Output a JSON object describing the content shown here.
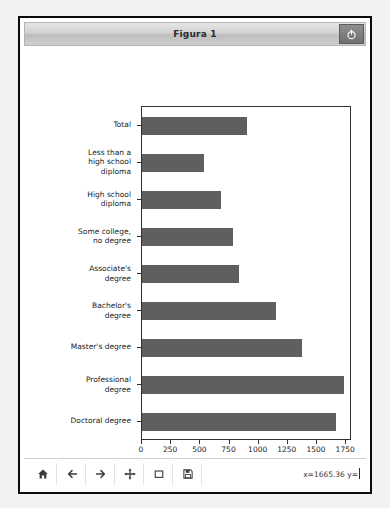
{
  "window": {
    "title": "Figura 1",
    "power_button_icon": "power-icon"
  },
  "toolbar": {
    "buttons": [
      {
        "name": "home-icon",
        "tooltip": "Home"
      },
      {
        "name": "back-arrow-icon",
        "tooltip": "Back"
      },
      {
        "name": "forward-arrow-icon",
        "tooltip": "Forward"
      },
      {
        "name": "pan-move-icon",
        "tooltip": "Pan"
      },
      {
        "name": "zoom-rect-icon",
        "tooltip": "Zoom to rectangle"
      },
      {
        "name": "save-disk-icon",
        "tooltip": "Save"
      }
    ],
    "coordinates": "x=1665.36 y="
  },
  "chart_data": {
    "type": "bar",
    "orientation": "horizontal",
    "title": "",
    "xlabel": "Median weekly earnings (USD)",
    "ylabel": "",
    "categories": [
      "Total",
      "Less than a\nhigh school\ndiploma",
      "High school\ndiploma",
      "Some college,\nno degree",
      "Associate's\ndegree",
      "Bachelor's\ndegree",
      "Master's degree",
      "Professional\ndegree",
      "Doctoral degree"
    ],
    "values": [
      900,
      535,
      680,
      780,
      830,
      1150,
      1370,
      1735,
      1665
    ],
    "xticks": [
      0,
      250,
      500,
      750,
      1000,
      1250,
      1500,
      1750
    ],
    "xlim": [
      0,
      1800
    ],
    "grid": false,
    "legend": null,
    "bar_color": "#5f5f5f"
  }
}
